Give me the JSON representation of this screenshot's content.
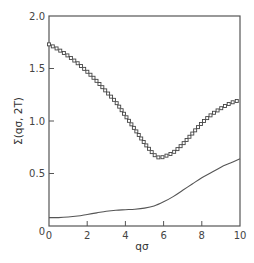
{
  "chart_data": {
    "type": "line",
    "title": "",
    "xlabel": "qσ",
    "ylabel": "Σ(qσ, 2T)",
    "xlim": [
      0,
      10
    ],
    "ylim": [
      0,
      2.0
    ],
    "grid": false,
    "legend": null,
    "x_ticks": [
      "0",
      "2",
      "4",
      "6",
      "8",
      "10"
    ],
    "y_ticks": [
      "0",
      "0.5",
      "1.0",
      "1.5",
      "2.0"
    ],
    "series": [
      {
        "name": "squares",
        "style": "open-square-markers",
        "x": [
          0,
          0.5,
          1,
          1.5,
          2,
          2.5,
          3,
          3.5,
          4,
          4.5,
          5,
          5.5,
          5.8,
          6,
          6.5,
          7,
          7.5,
          8,
          8.5,
          9,
          9.5,
          10
        ],
        "y": [
          1.73,
          1.68,
          1.62,
          1.55,
          1.47,
          1.38,
          1.28,
          1.18,
          1.05,
          0.92,
          0.79,
          0.68,
          0.65,
          0.66,
          0.7,
          0.78,
          0.88,
          0.98,
          1.06,
          1.12,
          1.17,
          1.2
        ]
      },
      {
        "name": "solid",
        "style": "solid-line",
        "x": [
          0,
          0.5,
          1,
          1.5,
          2,
          2.5,
          3,
          3.5,
          4,
          4.5,
          5,
          5.5,
          6,
          6.5,
          7,
          7.5,
          8,
          8.5,
          9,
          9.5,
          10
        ],
        "y": [
          0.08,
          0.08,
          0.085,
          0.095,
          0.11,
          0.125,
          0.14,
          0.15,
          0.155,
          0.16,
          0.17,
          0.19,
          0.23,
          0.28,
          0.34,
          0.4,
          0.46,
          0.51,
          0.56,
          0.6,
          0.64
        ]
      }
    ]
  }
}
